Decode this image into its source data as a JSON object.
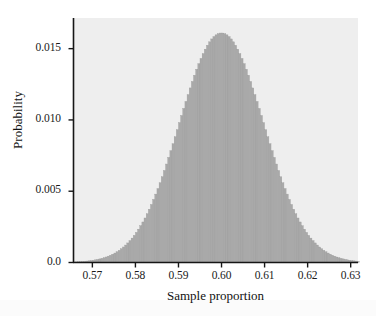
{
  "chart_data": {
    "type": "bar",
    "title": "",
    "subtitle": "",
    "xlabel": "Sample proportion",
    "ylabel": "Probability",
    "xlim": [
      0.5655,
      0.6317
    ],
    "ylim": [
      0.0,
      0.01715
    ],
    "grid": false,
    "legend": null,
    "annotations": [],
    "distribution": {
      "shape": "normal",
      "mean": 0.6,
      "sd": 0.0098,
      "peak_value": 0.0161,
      "bin_width": 0.0005
    },
    "xticks": [
      {
        "value": 0.57,
        "label": "0.57"
      },
      {
        "value": 0.58,
        "label": "0.58"
      },
      {
        "value": 0.59,
        "label": "0.59"
      },
      {
        "value": 0.6,
        "label": "0.60"
      },
      {
        "value": 0.61,
        "label": "0.61"
      },
      {
        "value": 0.62,
        "label": "0.62"
      },
      {
        "value": 0.63,
        "label": "0.63"
      }
    ],
    "yticks": [
      {
        "value": 0.0,
        "label": "0.0"
      },
      {
        "value": 0.005,
        "label": "0.005"
      },
      {
        "value": 0.01,
        "label": "0.010"
      },
      {
        "value": 0.015,
        "label": "0.015"
      }
    ],
    "x": [
      0.566,
      0.567,
      0.568,
      0.569,
      0.57,
      0.571,
      0.572,
      0.573,
      0.574,
      0.575,
      0.576,
      0.577,
      0.578,
      0.579,
      0.58,
      0.581,
      0.582,
      0.583,
      0.584,
      0.585,
      0.586,
      0.587,
      0.588,
      0.589,
      0.59,
      0.591,
      0.592,
      0.593,
      0.594,
      0.595,
      0.596,
      0.597,
      0.598,
      0.599,
      0.6,
      0.601,
      0.602,
      0.603,
      0.604,
      0.605,
      0.606,
      0.607,
      0.608,
      0.609,
      0.61,
      0.611,
      0.612,
      0.613,
      0.614,
      0.615,
      0.616,
      0.617,
      0.618,
      0.619,
      0.62,
      0.621,
      0.622,
      0.623,
      0.624,
      0.625,
      0.626,
      0.627,
      0.628,
      0.629,
      0.63,
      0.631
    ],
    "values": [
      4e-05,
      7e-05,
      0.00011,
      0.00018,
      0.00028,
      0.00043,
      0.00064,
      0.00094,
      0.00134,
      0.00188,
      0.00258,
      0.00348,
      0.0046,
      0.00596,
      0.00759,
      0.00949,
      0.01164,
      0.014,
      0.01652,
      0.01911,
      0.02167,
      0.02408,
      0.02622,
      0.02797,
      0.02921,
      0.02985,
      0.02985,
      0.02921,
      0.02797,
      0.02622,
      0.02408,
      0.02167,
      0.01911,
      0.01652,
      0.014,
      0.01164,
      0.00949,
      0.00759,
      0.00596,
      0.0046,
      0.00348,
      0.00258,
      0.00188,
      0.00134,
      0.00094,
      0.00064,
      0.00043,
      0.00028,
      0.00018,
      0.00011,
      7e-05,
      4e-05,
      2e-05,
      1e-05,
      1e-05,
      0.0,
      0.0,
      0.0,
      0.0,
      0.0,
      0.0,
      0.0,
      0.0,
      0.0,
      0.0,
      0.0
    ],
    "colors": {
      "bar_fill": "#a9a9a9",
      "bar_edge": "#9b9b9b",
      "plot_background": "#eeeeee",
      "figure_background": "#ffffff",
      "axis": "#161616",
      "text": "#1a1a1a"
    }
  }
}
